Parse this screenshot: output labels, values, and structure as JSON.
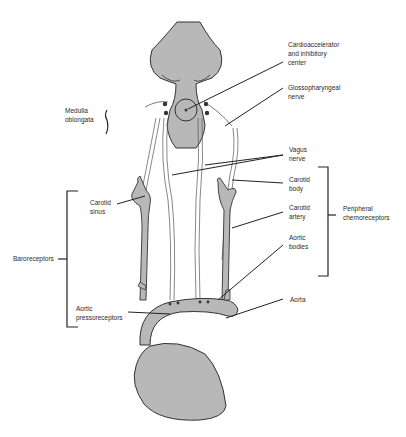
{
  "diagram": {
    "colors": {
      "tissue": "#b8b8b8",
      "outline": "#333333",
      "nerve": "#555555",
      "label": "#2a2a2a"
    },
    "labels": {
      "cardio_center": "Cardioaccelerator\nand inhibitory\ncenter",
      "glossopharyngeal": "Glossopharyngeal\nnerve",
      "medulla": "Medulla\noblongata",
      "vagus": "Vagus\nnerve",
      "carotid_body": "Carotid\nbody",
      "carotid_sinus": "Carotid\nsinus",
      "carotid_artery": "Carotid\nartery",
      "peripheral_chemo": "Peripheral\nchemoreceptors",
      "baroreceptors": "Baroreceptors",
      "aortic_bodies": "Aortic\nbodies",
      "aortic_pressoreceptors": "Aortic\npressoreceptors",
      "aorta": "Aorta"
    },
    "groups": [
      {
        "name": "Baroreceptors",
        "members": [
          "Carotid sinus",
          "Aortic pressoreceptors"
        ]
      },
      {
        "name": "Peripheral chemoreceptors",
        "members": [
          "Carotid body",
          "Carotid artery",
          "Aortic bodies"
        ]
      }
    ]
  }
}
